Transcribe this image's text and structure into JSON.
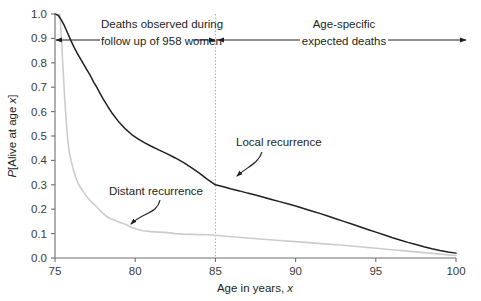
{
  "chart_data": {
    "type": "line",
    "title": "",
    "xlabel": "Age in years, x",
    "ylabel": "P[Alive at age x]",
    "xlim": [
      75,
      100
    ],
    "ylim": [
      0.0,
      1.0
    ],
    "grid": false,
    "legend_position": "inline-annotations",
    "xticks": [
      "75",
      "80",
      "85",
      "90",
      "95",
      "100"
    ],
    "xtick_values": [
      75,
      80,
      85,
      90,
      95,
      100
    ],
    "yticks": [
      "0.0",
      "0.1",
      "0.2",
      "0.3",
      "0.4",
      "0.5",
      "0.6",
      "0.7",
      "0.8",
      "0.9",
      "1.0"
    ],
    "ytick_values": [
      0.0,
      0.1,
      0.2,
      0.3,
      0.4,
      0.5,
      0.6,
      0.7,
      0.8,
      0.9,
      1.0
    ],
    "series": [
      {
        "name": "Local recurrence",
        "color": "#231f20",
        "label_x": 87.0,
        "label_y": 0.42,
        "x": [
          75.0,
          75.2,
          75.4,
          75.6,
          75.8,
          76.0,
          76.2,
          76.4,
          76.6,
          76.8,
          77.0,
          77.2,
          77.4,
          77.6,
          77.8,
          78.0,
          78.3,
          78.6,
          79.0,
          79.4,
          79.8,
          80.2,
          80.6,
          81.0,
          81.5,
          82.0,
          82.5,
          83.0,
          83.5,
          84.0,
          84.5,
          85.0,
          85.5,
          86.0,
          86.5,
          87.0,
          87.5,
          88.0,
          88.5,
          89.0,
          89.5,
          90.0,
          90.5,
          91.0,
          91.5,
          92.0,
          92.5,
          93.0,
          93.5,
          94.0,
          94.5,
          95.0,
          95.5,
          96.0,
          96.5,
          97.0,
          97.5,
          98.0,
          98.5,
          99.0,
          99.5,
          100.0
        ],
        "y": [
          1.0,
          0.995,
          0.975,
          0.95,
          0.92,
          0.89,
          0.862,
          0.838,
          0.815,
          0.793,
          0.77,
          0.748,
          0.722,
          0.7,
          0.676,
          0.652,
          0.62,
          0.59,
          0.556,
          0.528,
          0.505,
          0.487,
          0.472,
          0.458,
          0.442,
          0.427,
          0.41,
          0.392,
          0.37,
          0.348,
          0.322,
          0.3,
          0.292,
          0.283,
          0.275,
          0.266,
          0.258,
          0.249,
          0.24,
          0.231,
          0.222,
          0.213,
          0.203,
          0.193,
          0.183,
          0.172,
          0.161,
          0.15,
          0.139,
          0.128,
          0.117,
          0.106,
          0.095,
          0.084,
          0.074,
          0.064,
          0.055,
          0.046,
          0.038,
          0.031,
          0.025,
          0.02
        ]
      },
      {
        "name": "Distant recurrence",
        "color": "#cccccc",
        "label_x": 79.6,
        "label_y": 0.265,
        "x": [
          75.3,
          75.4,
          75.5,
          75.6,
          75.7,
          75.8,
          75.9,
          76.0,
          76.15,
          76.3,
          76.45,
          76.6,
          76.8,
          77.0,
          77.2,
          77.4,
          77.6,
          77.8,
          78.0,
          78.2,
          78.4,
          78.6,
          78.9,
          79.2,
          79.5,
          79.8,
          80.1,
          80.5,
          81.0,
          81.5,
          82.0,
          82.5,
          83.0,
          83.5,
          84.0,
          84.5,
          85.0,
          85.5,
          86.0,
          87.0,
          88.0,
          89.0,
          90.0,
          91.0,
          92.0,
          93.0,
          94.0,
          95.0,
          96.0,
          97.0,
          98.0,
          99.0,
          100.0
        ],
        "y": [
          1.0,
          0.9,
          0.78,
          0.66,
          0.56,
          0.48,
          0.43,
          0.4,
          0.36,
          0.33,
          0.305,
          0.288,
          0.268,
          0.25,
          0.235,
          0.222,
          0.21,
          0.196,
          0.183,
          0.172,
          0.163,
          0.158,
          0.15,
          0.142,
          0.135,
          0.125,
          0.118,
          0.112,
          0.108,
          0.106,
          0.104,
          0.1,
          0.098,
          0.097,
          0.096,
          0.095,
          0.093,
          0.09,
          0.087,
          0.082,
          0.077,
          0.072,
          0.067,
          0.062,
          0.057,
          0.052,
          0.046,
          0.04,
          0.034,
          0.028,
          0.022,
          0.016,
          0.01
        ]
      }
    ],
    "annotations": [
      {
        "name": "observed-period",
        "text_line1": "Deaths observed during",
        "text_line2": "follow up of 958 women",
        "span_from": 75,
        "span_to": 85,
        "arrow_style": "double-ended"
      },
      {
        "name": "expected-period",
        "text_line1": "Age-specific",
        "text_line2": "expected deaths",
        "span_from": 85,
        "span_to": 100,
        "arrow_style": "double-ended"
      }
    ],
    "reference_line": {
      "name": "age-85-divider",
      "x": 85,
      "style": "dotted"
    }
  }
}
